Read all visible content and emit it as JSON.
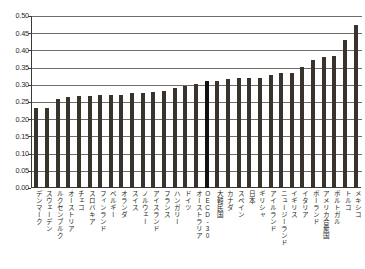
{
  "chart_data": {
    "type": "bar",
    "title": "",
    "subtitle": "",
    "xlabel": "",
    "ylabel": "",
    "ylim": [
      0.0,
      0.5
    ],
    "ytick_labels": [
      "0.50",
      "0.45",
      "0.40",
      "0.35",
      "0.30",
      "0.25",
      "0.20",
      "0.15",
      "0.10",
      "0.05",
      "0.00"
    ],
    "ytick_values": [
      0.5,
      0.45,
      0.4,
      0.35,
      0.3,
      0.25,
      0.2,
      0.15,
      0.1,
      0.05,
      0.0
    ],
    "grid": true,
    "grid_axis": "y",
    "legend": "none",
    "legend_position": "none",
    "bar_color": "#3a332c",
    "highlight_color": "#111110",
    "highlight_category": "OECD-30",
    "categories": [
      "デンマーク",
      "スウェーデン",
      "ルクセンブルク",
      "オーストリア",
      "チェコ",
      "スロバキア",
      "フィンランド",
      "ベルギー",
      "オランダ",
      "スイス",
      "ノルウェー",
      "アイスランド",
      "フランス",
      "ハンガリー",
      "ドイツ",
      "オーストラリア",
      "OECD-30",
      "大韓民国",
      "カナダ",
      "スペイン",
      "日本",
      "ギリシャ",
      "アイルランド",
      "ニュージーランド",
      "イギリス",
      "イタリア",
      "ポーランド",
      "アメリカ合衆国",
      "ポルトガル",
      "トルコ",
      "メキシコ"
    ],
    "values": [
      0.232,
      0.234,
      0.258,
      0.265,
      0.268,
      0.268,
      0.269,
      0.271,
      0.271,
      0.276,
      0.276,
      0.28,
      0.281,
      0.291,
      0.298,
      0.301,
      0.311,
      0.312,
      0.317,
      0.319,
      0.321,
      0.321,
      0.328,
      0.335,
      0.335,
      0.352,
      0.372,
      0.381,
      0.385,
      0.43,
      0.474
    ]
  }
}
